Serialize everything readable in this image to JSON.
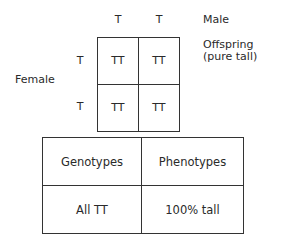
{
  "male": {
    "label": "Male",
    "alleles": [
      "T",
      "T"
    ]
  },
  "female": {
    "label": "Female",
    "alleles": [
      "T",
      "T"
    ]
  },
  "offspring": {
    "label_line1": "Offspring",
    "label_line2": "(pure tall)"
  },
  "punnett": {
    "cells": [
      [
        "TT",
        "TT"
      ],
      [
        "TT",
        "TT"
      ]
    ]
  },
  "summary_table": {
    "headers": [
      "Genotypes",
      "Phenotypes"
    ],
    "rows": [
      [
        "All TT",
        "100% tall"
      ]
    ]
  }
}
